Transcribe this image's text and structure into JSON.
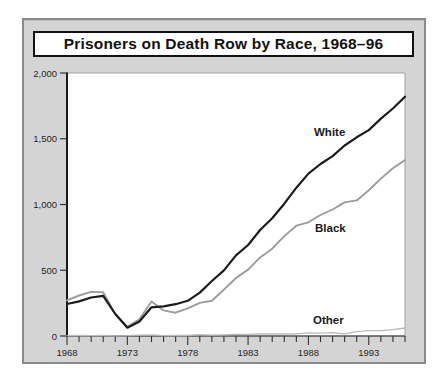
{
  "chart_data": {
    "type": "line",
    "title": "Prisoners on Death Row by Race, 1968–96",
    "xlabel": "",
    "ylabel": "",
    "x_range": [
      1968,
      1996
    ],
    "ylim": [
      0,
      2000
    ],
    "grid": false,
    "legend_position": "inline-labels",
    "background_color": "#d4d4d4",
    "plot_background_color": "#ffffff",
    "x": [
      1968,
      1969,
      1970,
      1971,
      1972,
      1973,
      1974,
      1975,
      1976,
      1977,
      1978,
      1979,
      1980,
      1981,
      1982,
      1983,
      1984,
      1985,
      1986,
      1987,
      1988,
      1989,
      1990,
      1991,
      1992,
      1993,
      1994,
      1995,
      1996
    ],
    "series": [
      {
        "name": "White",
        "color": "#1c1c1c",
        "values": [
          243,
          263,
          293,
          306,
          167,
          63,
          110,
          218,
          225,
          242,
          268,
          330,
          418,
          499,
          613,
          692,
          806,
          896,
          1006,
          1128,
          1235,
          1308,
          1368,
          1449,
          1511,
          1566,
          1653,
          1730,
          1820
        ]
      },
      {
        "name": "Black",
        "color": "#9c9c9c",
        "values": [
          271,
          308,
          335,
          332,
          166,
          69,
          128,
          262,
          195,
          177,
          210,
          252,
          268,
          353,
          441,
          505,
          598,
          664,
          760,
          839,
          865,
          920,
          962,
          1016,
          1031,
          1109,
          1197,
          1275,
          1338
        ]
      },
      {
        "name": "Other",
        "color": "#b9b9b9",
        "values": [
          3,
          4,
          3,
          4,
          1,
          2,
          6,
          8,
          3,
          4,
          4,
          11,
          6,
          8,
          12,
          12,
          16,
          15,
          15,
          17,
          24,
          22,
          26,
          17,
          33,
          41,
          40,
          49,
          61
        ]
      }
    ],
    "y_tick_values": [
      0,
      500,
      1000,
      1500,
      2000
    ],
    "y_tick_labels": [
      "0",
      "500",
      "1,000",
      "1,500",
      "2,000"
    ],
    "x_tick_values": [
      1968,
      1973,
      1978,
      1983,
      1988,
      1993
    ],
    "x_tick_labels": [
      "1968",
      "1973",
      "1978",
      "1983",
      "1988",
      "1993"
    ],
    "x_minor_tick_step_years": 1,
    "axis_text_color": "#262626"
  }
}
